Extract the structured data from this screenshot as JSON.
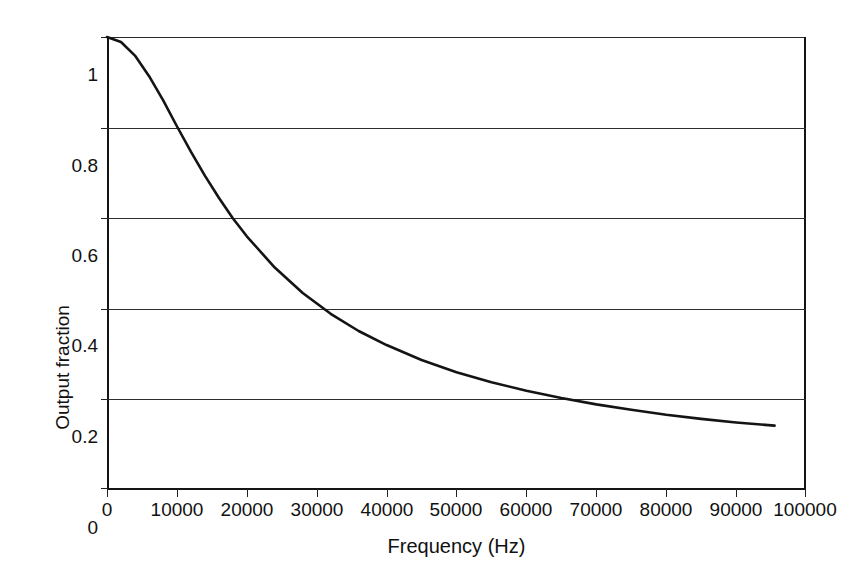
{
  "chart_data": {
    "type": "line",
    "title": "",
    "xlabel": "Frequency (Hz)",
    "ylabel": "Output fraction",
    "xlim": [
      0,
      100000
    ],
    "ylim": [
      0,
      1
    ],
    "grid": "horizontal",
    "legend": "none",
    "xticks": [
      0,
      10000,
      20000,
      30000,
      40000,
      50000,
      60000,
      70000,
      80000,
      90000,
      100000
    ],
    "xtick_labels": [
      "0",
      "10000",
      "20000",
      "30000",
      "40000",
      "50000",
      "60000",
      "70000",
      "80000",
      "90000",
      "100000"
    ],
    "yticks": [
      0,
      0.2,
      0.4,
      0.6,
      0.8,
      1
    ],
    "ytick_labels": [
      "0",
      "0.2",
      "0.4",
      "0.6",
      "0.8",
      "1"
    ],
    "series": [
      {
        "name": "Output fraction",
        "color": "#141414",
        "x": [
          0,
          2000,
          4000,
          6000,
          8000,
          10000,
          12000,
          14000,
          16000,
          18000,
          20000,
          24000,
          28000,
          32000,
          36000,
          40000,
          45000,
          50000,
          55000,
          60000,
          65000,
          70000,
          75000,
          80000,
          85000,
          90000,
          95500
        ],
        "y": [
          1.0,
          0.989,
          0.959,
          0.914,
          0.861,
          0.803,
          0.747,
          0.694,
          0.645,
          0.6,
          0.56,
          0.491,
          0.435,
          0.389,
          0.351,
          0.32,
          0.287,
          0.26,
          0.238,
          0.219,
          0.203,
          0.189,
          0.177,
          0.166,
          0.157,
          0.149,
          0.142
        ]
      }
    ],
    "annotations": []
  },
  "axes": {
    "ylabel": "Output fraction",
    "xlabel": "Frequency (Hz)"
  }
}
